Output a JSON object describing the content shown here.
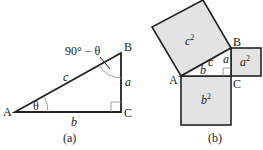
{
  "panel_a": {
    "caption": "(a)",
    "vertices": {
      "A": "A",
      "B": "B",
      "C": "C"
    },
    "sides": {
      "hypotenuse": "c",
      "vertical": "a",
      "horizontal": "b"
    },
    "angle_A": "θ",
    "angle_B": "90° − θ"
  },
  "panel_b": {
    "caption": "(b)",
    "vertices": {
      "A": "A",
      "B": "B",
      "C": "C"
    },
    "sides": {
      "hypotenuse": "c",
      "vertical": "a",
      "horizontal": "b"
    },
    "squares": {
      "c_square": "c",
      "a_square": "a",
      "b_square": "b"
    },
    "exponent": "2"
  },
  "colors": {
    "square_fill": "#e3e3e3",
    "stroke": "#222222"
  }
}
